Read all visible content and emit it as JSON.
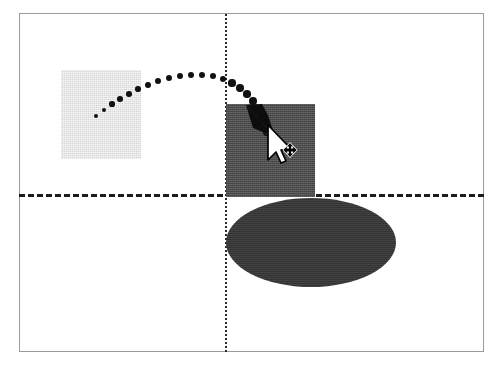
{
  "diagram": {
    "canvas": {
      "width": 499,
      "height": 368,
      "background": "#ffffff"
    },
    "frame": {
      "label": "drawing-frame",
      "x": 19,
      "y": 13,
      "width": 465,
      "height": 339,
      "border_color": "#9a9a9a",
      "border_width": 1
    },
    "guides": [
      {
        "name": "horizontal-guide",
        "orientation": "horizontal",
        "style": "dashed",
        "y": 194,
        "x1": 19,
        "x2": 484,
        "color": "#1c1c1c",
        "thickness": 3,
        "dash": "9 5"
      },
      {
        "name": "vertical-guide",
        "orientation": "vertical",
        "style": "dotted",
        "x": 225,
        "y1": 14,
        "y2": 352,
        "color": "#2a2a2a",
        "thickness": 2,
        "dash": "2 5"
      }
    ],
    "shapes": [
      {
        "name": "source-square",
        "role": "original position",
        "type": "rectangle",
        "x": 61,
        "y": 70,
        "width": 80,
        "height": 89,
        "fill": "#d7d7d7",
        "fill_label": "light gray"
      },
      {
        "name": "target-square",
        "role": "dragged position",
        "type": "rectangle",
        "x": 226,
        "y": 104,
        "width": 89,
        "height": 93,
        "fill": "#4d4d4d",
        "fill_label": "dark gray"
      },
      {
        "name": "drop-ellipse",
        "role": "drop target",
        "type": "ellipse",
        "x": 226,
        "y": 198,
        "width": 170,
        "height": 89,
        "fill": "#333333",
        "fill_label": "near black"
      }
    ],
    "drag_path": {
      "name": "motion-trail",
      "style": "dotted-arc",
      "color": "#111111",
      "dot_count": 22,
      "dot_radius_start": 2.4,
      "dot_radius_end": 4.0,
      "points": [
        [
          96,
          116
        ],
        [
          104,
          110
        ],
        [
          112,
          104
        ],
        [
          120,
          99
        ],
        [
          129,
          94
        ],
        [
          138,
          89
        ],
        [
          148,
          85
        ],
        [
          158,
          81
        ],
        [
          169,
          78
        ],
        [
          180,
          76
        ],
        [
          191,
          75
        ],
        [
          202,
          75
        ],
        [
          213,
          76
        ],
        [
          223,
          79
        ],
        [
          232,
          83
        ],
        [
          240,
          88
        ],
        [
          247,
          94
        ],
        [
          253,
          101
        ],
        [
          258,
          109
        ],
        [
          262,
          117
        ]
      ]
    },
    "arrowhead": {
      "name": "drag-arrowhead",
      "tip_x": 273,
      "tip_y": 134,
      "fill": "#0d0d0d",
      "direction": "down-right"
    },
    "cursor": {
      "name": "move-cursor",
      "type": "arrow-with-move-badge",
      "hotspot_x": 267,
      "hotspot_y": 128,
      "fill": "#ffffff",
      "outline": "#000000",
      "badge": "four-way-move"
    }
  }
}
